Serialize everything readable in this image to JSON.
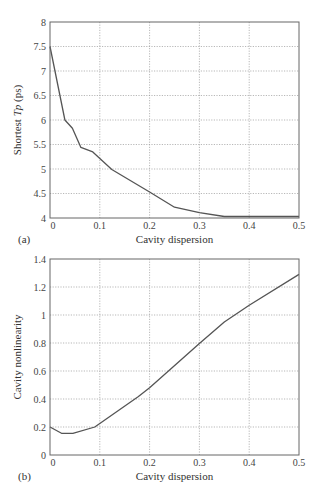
{
  "chart_data": [
    {
      "panel": "(a)",
      "type": "line",
      "title": "",
      "xlabel": "Cavity dispersion",
      "ylabel_parts": [
        "Shortest ",
        "Tp",
        " (ps)"
      ],
      "ylabel": "Shortest Tp (ps)",
      "xlim": [
        0,
        0.5
      ],
      "ylim": [
        4,
        8
      ],
      "xticks": [
        0,
        0.1,
        0.2,
        0.3,
        0.4,
        0.5
      ],
      "xtick_labels": [
        "0",
        "0.1",
        "0.2",
        "0.3",
        "0.4",
        "0.5"
      ],
      "yticks": [
        4,
        4.5,
        5,
        5.5,
        6,
        6.5,
        7,
        7.5,
        8
      ],
      "ytick_labels": [
        "4",
        "4.5",
        "5",
        "5.5",
        "6",
        "6.5",
        "7",
        "7.5",
        "8"
      ],
      "grid": true,
      "legend": null,
      "series": [
        {
          "name": "Shortest Tp",
          "x": [
            0,
            0.03,
            0.045,
            0.062,
            0.086,
            0.124,
            0.2,
            0.25,
            0.3,
            0.35,
            0.4,
            0.5
          ],
          "y": [
            7.5,
            6.0,
            5.83,
            5.44,
            5.35,
            4.99,
            4.53,
            4.22,
            4.11,
            4.03,
            4.03,
            4.03
          ]
        }
      ]
    },
    {
      "panel": "(b)",
      "type": "line",
      "title": "",
      "xlabel": "Cavity dispersion",
      "ylabel": "Cavity nonlinearity",
      "xlim": [
        0,
        0.5
      ],
      "ylim": [
        0,
        1.4
      ],
      "xticks": [
        0,
        0.1,
        0.2,
        0.3,
        0.4,
        0.5
      ],
      "xtick_labels": [
        "0",
        "0.1",
        "0.2",
        "0.3",
        "0.4",
        "0.5"
      ],
      "yticks": [
        0,
        0.2,
        0.4,
        0.6,
        0.8,
        1,
        1.2,
        1.4
      ],
      "ytick_labels": [
        "0",
        "0.2",
        "0.4",
        "0.6",
        "0.8",
        "1",
        "1.2",
        "1.4"
      ],
      "grid": true,
      "legend": null,
      "series": [
        {
          "name": "Cavity nonlinearity",
          "x": [
            0,
            0.023,
            0.046,
            0.09,
            0.177,
            0.2,
            0.3,
            0.35,
            0.4,
            0.5
          ],
          "y": [
            0.2,
            0.155,
            0.155,
            0.2,
            0.416,
            0.48,
            0.797,
            0.95,
            1.07,
            1.29
          ]
        }
      ]
    }
  ],
  "colors": {
    "curve": "#555555",
    "frame": "#666666",
    "grid": "#9a9a9a",
    "background": "#ffffff"
  },
  "layout": {
    "panels": [
      {
        "left": 50,
        "right": 299,
        "top": 22,
        "bottom": 218,
        "xlabel_y": 243,
        "panel_label_x": 18
      },
      {
        "left": 50,
        "right": 299,
        "top": 259,
        "bottom": 455,
        "xlabel_y": 480,
        "panel_label_x": 18
      }
    ]
  }
}
